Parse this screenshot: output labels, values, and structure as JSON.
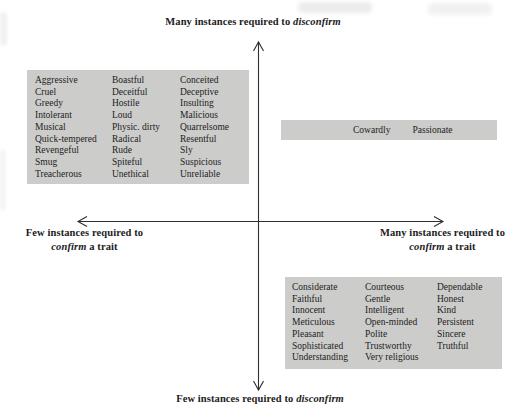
{
  "colors": {
    "background": "#ffffff",
    "box_fill": "#cccccb",
    "axis_stroke": "#2f2f2f",
    "text": "#1c1c1c"
  },
  "axis_labels": {
    "top": {
      "text": "Many instances required to",
      "emphasis": "disconfirm"
    },
    "bottom": {
      "text": "Few instances required to",
      "emphasis": "disconfirm"
    },
    "left": {
      "line1": "Few instances required to",
      "emphasis": "confirm",
      "line2_rest": "a trait"
    },
    "right": {
      "line1": "Many instances required to",
      "emphasis": "confirm",
      "line2_rest": "a trait"
    }
  },
  "trait_boxes": {
    "top_left": {
      "columns": [
        [
          "Aggressive",
          "Cruel",
          "Greedy",
          "Intolerant",
          "Musical",
          "Quick-tempered",
          "Revengeful",
          "Smug",
          "Treacherous"
        ],
        [
          "Boastful",
          "Deceitful",
          "Hostile",
          "Loud",
          "Physic. dirty",
          "Radical",
          "Rude",
          "Spiteful",
          "Unethical"
        ],
        [
          "Conceited",
          "Deceptive",
          "Insulting",
          "Malicious",
          "Quarrelsome",
          "Resentful",
          "Sly",
          "Suspicious",
          "Unreliable"
        ]
      ]
    },
    "top_right": {
      "items": [
        "Cowardly",
        "Passionate"
      ]
    },
    "bottom_right": {
      "columns": [
        [
          "Considerate",
          "Faithful",
          "Innocent",
          "Meticulous",
          "Pleasant",
          "Sophisticated",
          "Understanding"
        ],
        [
          "Courteous",
          "Gentle",
          "Intelligent",
          "Open-minded",
          "Polite",
          "Trustworthy",
          "Very religious"
        ],
        [
          "Dependable",
          "Honest",
          "Kind",
          "Persistent",
          "Sincere",
          "Truthful"
        ]
      ]
    }
  }
}
